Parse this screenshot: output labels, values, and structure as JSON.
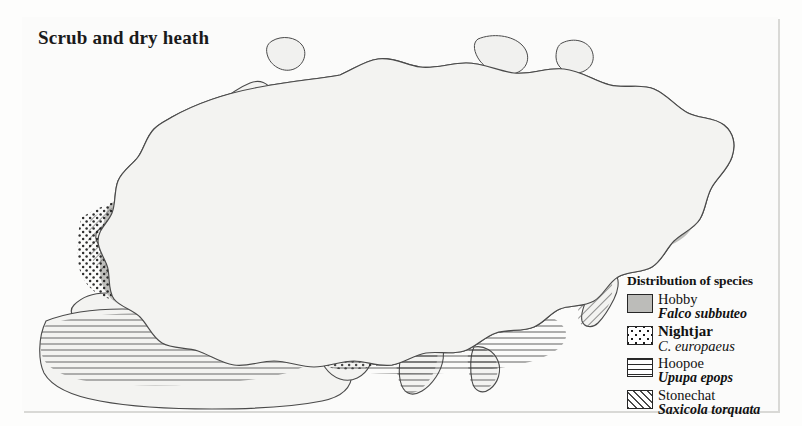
{
  "figure": {
    "title": "Scrub and dry heath",
    "frame_color": "#3a3a3a",
    "background_color": "#fbfbfa"
  },
  "legend": {
    "title": "Distribution of species",
    "entries": [
      {
        "common_name": "Hobby",
        "latin_name": "Falco subbuteo",
        "pattern": "solid-gray",
        "swatch_color": "#b9b9b6"
      },
      {
        "common_name": "Nightjar",
        "latin_name": "C. europaeus",
        "pattern": "dots",
        "swatch_color": "#1d1d1d"
      },
      {
        "common_name": "Hoopoe",
        "latin_name": "Upupa epops",
        "pattern": "horizontal-lines",
        "swatch_color": "#2a2a2a"
      },
      {
        "common_name": "Stonechat",
        "latin_name": "Saxicola torquata",
        "pattern": "diagonal-hatch",
        "swatch_color": "#2a2a2a"
      }
    ]
  },
  "map": {
    "region_description": "Eurasia and North Africa",
    "coastline_color": "#4a4a4a",
    "land_fill": "#f2f2f0",
    "distribution_overlays": [
      {
        "species": "Hobby",
        "regions": "Europe, central and northern Asia"
      },
      {
        "species": "Nightjar",
        "regions": "Europe, Scandinavia, central Asia"
      },
      {
        "species": "Hoopoe",
        "regions": "North Africa, Arabia, India, southern Asia"
      },
      {
        "species": "Stonechat",
        "regions": "Western Europe, Britain, Japan, northern Asia belt"
      }
    ]
  }
}
